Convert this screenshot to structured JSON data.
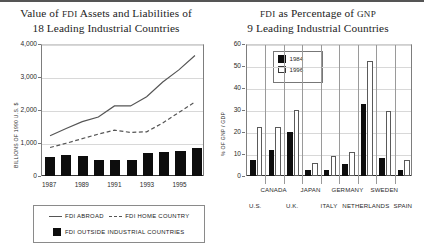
{
  "figure": {
    "background": "#ffffff",
    "ink": "#0d0d0d"
  },
  "left_panel": {
    "title_line1_a": "Value of ",
    "title_line1_sc": "FDI",
    "title_line1_b": " Assets and Liabilities of",
    "title_line2": "18 Leading Industrial Countries",
    "legend": {
      "abroad": "FDI ABROAD",
      "home": "FDI HOME COUNTRY",
      "outside": "FDI OUTSIDE INDUSTRIAL COUNTRIES"
    }
  },
  "right_panel": {
    "title_line1_a": "FDI",
    "title_line1_b": " as Percentage of ",
    "title_line1_c": "GNP",
    "title_line2": "9 Leading Industrial Countries",
    "legend": {
      "series1": "1984",
      "series2": "1996"
    }
  },
  "chart_data": [
    {
      "type": "bar",
      "id": "fdi-value",
      "title": "Value of FDI Assets and Liabilities of 18 Leading Industrial Countries",
      "xlabel": "",
      "ylabel": "BILLIONS OF 1990 U.S. $",
      "ylim": [
        0,
        4000
      ],
      "yticks": [
        0,
        1000,
        2000,
        3000,
        4000
      ],
      "ytick_labels": [
        "0",
        "1,000",
        "2,000",
        "3,000",
        "4,000"
      ],
      "grid": true,
      "x": [
        1987,
        1988,
        1989,
        1990,
        1991,
        1992,
        1993,
        1994,
        1995,
        1996
      ],
      "xtick_labels": [
        "1987",
        "1989",
        "1991",
        "1993",
        "1995"
      ],
      "xtick_values": [
        1987,
        1989,
        1991,
        1993,
        1995
      ],
      "legend_position": "below",
      "series": [
        {
          "name": "FDI OUTSIDE INDUSTRIAL COUNTRIES",
          "kind": "bar",
          "color": "#0d0d0d",
          "values": [
            570,
            650,
            620,
            490,
            495,
            500,
            700,
            730,
            760,
            840
          ]
        },
        {
          "name": "FDI ABROAD",
          "kind": "line-solid",
          "color": "#555555",
          "values": [
            1230,
            1450,
            1660,
            1800,
            2140,
            2140,
            2420,
            2870,
            3240,
            3680
          ]
        },
        {
          "name": "FDI HOME COUNTRY",
          "kind": "line-dashed",
          "color": "#555555",
          "values": [
            870,
            1000,
            1140,
            1280,
            1400,
            1330,
            1350,
            1620,
            1940,
            2260
          ]
        }
      ]
    },
    {
      "type": "bar",
      "id": "fdi-pct-gnp",
      "title": "FDI as Percentage of GNP — 9 Leading Industrial Countries",
      "xlabel": "",
      "ylabel": "% OF GNP / GDP",
      "ylim": [
        0,
        60
      ],
      "yticks": [
        0,
        10,
        20,
        30,
        40,
        50,
        60
      ],
      "ytick_labels": [
        "0",
        "10",
        "20",
        "30",
        "40",
        "50",
        "60"
      ],
      "grid": true,
      "legend_position": "inside-top-left",
      "categories": [
        "U.S.",
        "CANADA",
        "U.K.",
        "JAPAN",
        "ITALY",
        "GERMANY",
        "NETHERLANDS",
        "SWEDEN",
        "SPAIN"
      ],
      "category_rows": [
        1,
        0,
        1,
        0,
        1,
        0,
        1,
        0,
        1
      ],
      "series": [
        {
          "name": "1984",
          "color": "#0d0d0d",
          "values": [
            7.2,
            11.8,
            20.0,
            2.8,
            2.9,
            5.4,
            32.8,
            8.4,
            2.6
          ]
        },
        {
          "name": "1996",
          "color": "#ffffff",
          "values": [
            22.2,
            22.3,
            30.2,
            5.8,
            9.3,
            10.7,
            52.4,
            29.6,
            7.2
          ]
        }
      ]
    }
  ]
}
